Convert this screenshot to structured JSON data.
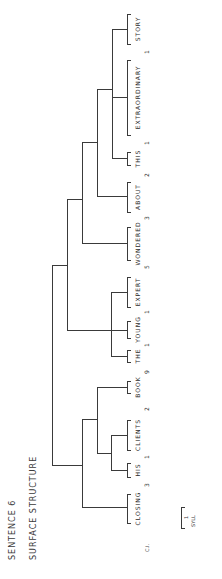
{
  "title": {
    "sentence": "SENTENCE 6",
    "structure": "SURFACE STRUCTURE"
  },
  "words": [
    {
      "label": "STORY",
      "y1": 14,
      "y2": 44
    },
    {
      "label": "EXTRAORDINARY",
      "y1": 60,
      "y2": 135
    },
    {
      "label": "THIS",
      "y1": 152,
      "y2": 165
    },
    {
      "label": "ABOUT",
      "y1": 182,
      "y2": 212
    },
    {
      "label": "WONDERED",
      "y1": 227,
      "y2": 260
    },
    {
      "label": "EXPERT",
      "y1": 277,
      "y2": 307
    },
    {
      "label": "YOUNG",
      "y1": 321,
      "y2": 338
    },
    {
      "label": "THE",
      "y1": 350,
      "y2": 362
    },
    {
      "label": "BOOK",
      "y1": 381,
      "y2": 393
    },
    {
      "label": "CLIENTS",
      "y1": 420,
      "y2": 450
    },
    {
      "label": "HIS",
      "y1": 463,
      "y2": 477
    },
    {
      "label": "CLOSING",
      "y1": 494,
      "y2": 523
    }
  ],
  "pause_values": [
    {
      "value": "1",
      "y": 52
    },
    {
      "value": "1",
      "y": 143
    },
    {
      "value": "2",
      "y": 175
    },
    {
      "value": "3",
      "y": 218
    },
    {
      "value": "5",
      "y": 267
    },
    {
      "value": "1",
      "y": 312
    },
    {
      "value": "1",
      "y": 345
    },
    {
      "value": "9",
      "y": 372
    },
    {
      "value": "2",
      "y": 409
    },
    {
      "value": "1",
      "y": 457
    },
    {
      "value": "3",
      "y": 485
    }
  ],
  "tree_segments": [
    {
      "x1": 112,
      "y1": 29,
      "x2": 112,
      "y2": 158
    },
    {
      "x1": 112,
      "y1": 29,
      "x2": 127,
      "y2": 29
    },
    {
      "x1": 112,
      "y1": 97,
      "x2": 127,
      "y2": 97
    },
    {
      "x1": 112,
      "y1": 158,
      "x2": 127,
      "y2": 158
    },
    {
      "x1": 97,
      "y1": 89,
      "x2": 112,
      "y2": 89
    },
    {
      "x1": 97,
      "y1": 89,
      "x2": 97,
      "y2": 196
    },
    {
      "x1": 97,
      "y1": 196,
      "x2": 127,
      "y2": 196
    },
    {
      "x1": 82,
      "y1": 142,
      "x2": 97,
      "y2": 142
    },
    {
      "x1": 82,
      "y1": 142,
      "x2": 82,
      "y2": 243
    },
    {
      "x1": 82,
      "y1": 243,
      "x2": 127,
      "y2": 243
    },
    {
      "x1": 67,
      "y1": 199,
      "x2": 82,
      "y2": 199
    },
    {
      "x1": 111,
      "y1": 292,
      "x2": 111,
      "y2": 356
    },
    {
      "x1": 111,
      "y1": 292,
      "x2": 127,
      "y2": 292
    },
    {
      "x1": 111,
      "y1": 330,
      "x2": 127,
      "y2": 330
    },
    {
      "x1": 111,
      "y1": 356,
      "x2": 127,
      "y2": 356
    },
    {
      "x1": 67,
      "y1": 330,
      "x2": 111,
      "y2": 330
    },
    {
      "x1": 67,
      "y1": 199,
      "x2": 67,
      "y2": 330
    },
    {
      "x1": 52,
      "y1": 265,
      "x2": 67,
      "y2": 265
    },
    {
      "x1": 111,
      "y1": 435,
      "x2": 111,
      "y2": 470
    },
    {
      "x1": 111,
      "y1": 435,
      "x2": 127,
      "y2": 435
    },
    {
      "x1": 111,
      "y1": 470,
      "x2": 127,
      "y2": 470
    },
    {
      "x1": 97,
      "y1": 453,
      "x2": 111,
      "y2": 453
    },
    {
      "x1": 97,
      "y1": 387,
      "x2": 97,
      "y2": 453
    },
    {
      "x1": 97,
      "y1": 387,
      "x2": 127,
      "y2": 387
    },
    {
      "x1": 82,
      "y1": 419,
      "x2": 97,
      "y2": 419
    },
    {
      "x1": 82,
      "y1": 419,
      "x2": 82,
      "y2": 507
    },
    {
      "x1": 82,
      "y1": 507,
      "x2": 127,
      "y2": 507
    },
    {
      "x1": 52,
      "y1": 465,
      "x2": 82,
      "y2": 465
    },
    {
      "x1": 52,
      "y1": 265,
      "x2": 52,
      "y2": 465
    }
  ],
  "footer": {
    "ci_label": "C.I.",
    "scale_value": "1",
    "scale_unit": "SYLL"
  }
}
